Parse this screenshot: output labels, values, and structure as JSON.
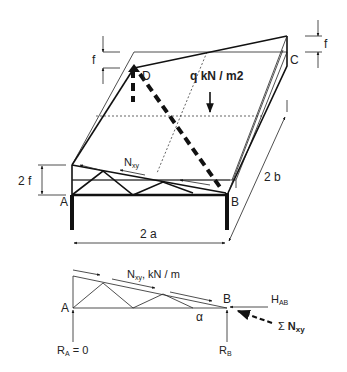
{
  "figure": {
    "upper_view": {
      "corner_labels": {
        "A": "A",
        "B": "B",
        "C": "C",
        "D": "D"
      },
      "load_label": "q kN / m2",
      "shear_label_main": "N",
      "shear_label_sub": "xy",
      "rise_label_left": "f",
      "rise_label_right": "f",
      "edge_height_label": "2 f",
      "span_x_label": "2 a",
      "span_y_label": "2 b"
    },
    "lower_view": {
      "corner_A": "A",
      "corner_B": "B",
      "shear_label_main": "N",
      "shear_label_sub": "xy",
      "shear_label_units": ", kN / m",
      "angle_label": "α",
      "horizontal_reaction_main": "H",
      "horizontal_reaction_sub": "AB",
      "reaction_A_main": "R",
      "reaction_A_sub": "A",
      "reaction_A_value": " = 0",
      "reaction_B_main": "R",
      "reaction_B_sub": "B",
      "sum_symbol": "Σ",
      "sum_main": "N",
      "sum_sub": "xy"
    }
  }
}
